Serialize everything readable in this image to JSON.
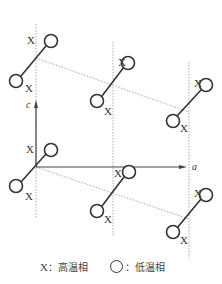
{
  "diagram": {
    "axes": {
      "c_label": "c",
      "a_label": "a"
    },
    "site_marker_label": "X",
    "legend": {
      "x_symbol": "X",
      "x_separator": "：",
      "x_text": "高温相",
      "circle_separator": "：",
      "circle_text": "低温相"
    },
    "colors": {
      "line": "#333333",
      "dotted": "#aaaaaa",
      "background": "#ffffff"
    }
  }
}
